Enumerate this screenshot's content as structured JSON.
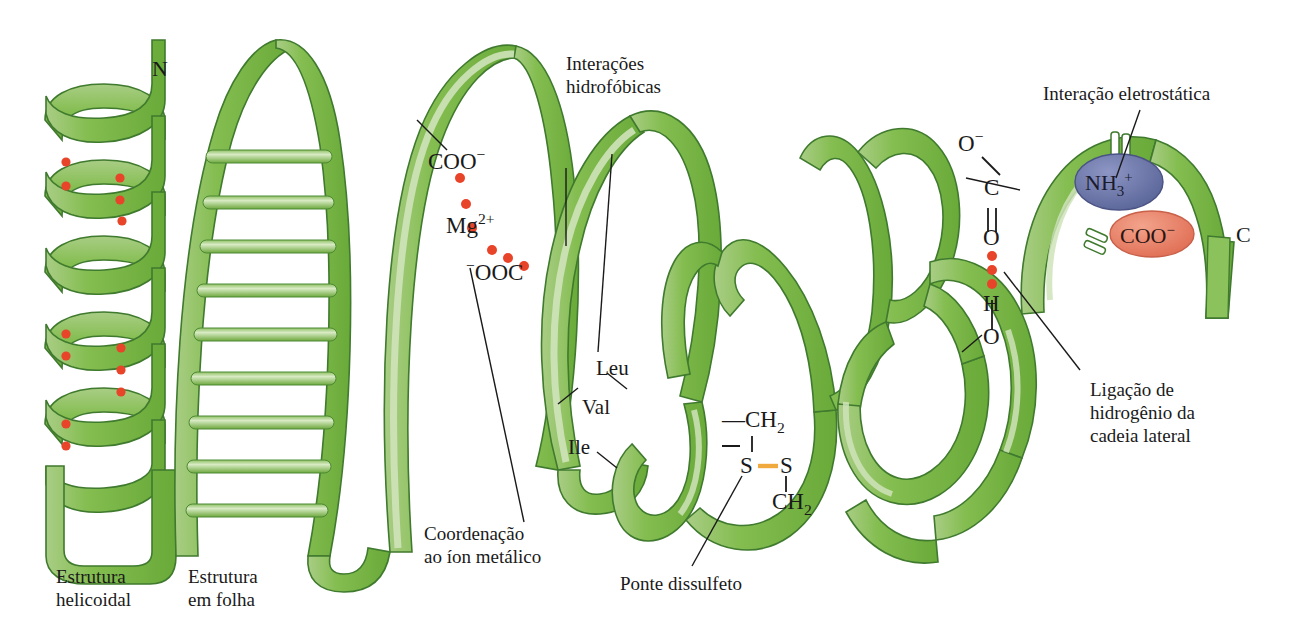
{
  "figure": {
    "background": "#ffffff",
    "ribbon_color": "#79b745",
    "ribbon_edge_color": "#bcd9a2",
    "ribbon_outline_color": "#3f7a2e",
    "hbond_dot_color": "#e8442a",
    "disulfide_color": "#f0a93c",
    "nh3_ellipse_color": "#6b75a8",
    "coo_ellipse_color": "#e8836d"
  },
  "terminals": {
    "n_terminus": "N",
    "c_terminus": "C"
  },
  "captions": {
    "helical_structure": [
      "Estrutura",
      "helicoidal"
    ],
    "sheet_structure": [
      "Estrutura",
      "em folha"
    ],
    "hydrophobic": [
      "Interações",
      "hidrofóbicas"
    ],
    "metal_coordination": [
      "Coordenação",
      "ao íon metálico"
    ],
    "disulfide_bridge": "Ponte dissulfeto",
    "electrostatic": "Interação eletrostática",
    "side_chain_hbond": [
      "Ligação de",
      "hidrogênio da",
      "cadeia lateral"
    ]
  },
  "metal_site": {
    "upper_carboxylate": "COO",
    "upper_carboxylate_charge": "−",
    "ion": "Mg",
    "ion_charge": "2+",
    "lower_carboxylate_charge": "−",
    "lower_carboxylate": "OOC"
  },
  "hydrophobic_residues": [
    {
      "label": "Leu"
    },
    {
      "label": "Val"
    },
    {
      "label": "Ile"
    }
  ],
  "disulfide": {
    "top_group": "CH",
    "top_group_sub": "2",
    "top_dash": "—",
    "sulfur_left": "S",
    "sulfur_right": "S",
    "bottom_group": "CH",
    "bottom_group_sub": "2"
  },
  "hydrogen_bond_chain": {
    "oxygen_anion": "O",
    "oxygen_anion_charge": "−",
    "carbon": "C",
    "carbonyl_oxygen": "O",
    "hydrogen": "H",
    "hydroxyl_oxygen": "O",
    "dot_count": 3
  },
  "ion_pair": {
    "cation": "NH",
    "cation_sub": "3",
    "cation_charge": "+",
    "anion": "COO",
    "anion_charge": "−"
  }
}
